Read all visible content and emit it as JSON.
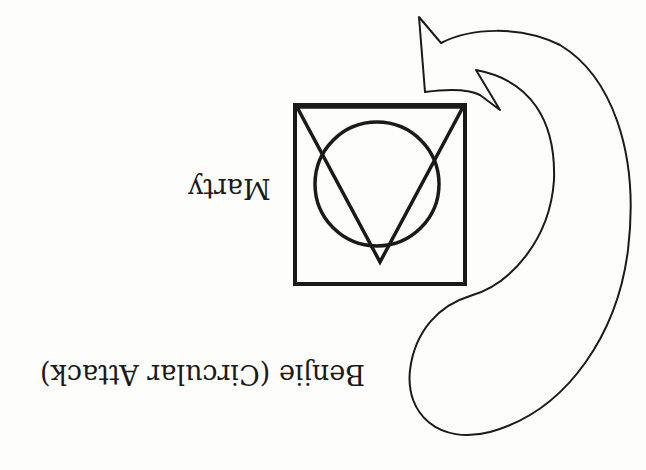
{
  "diagram": {
    "orientation": "rotated-180",
    "labels": {
      "marty": "Marty",
      "benjie": "Benjie (Circular Attack)"
    },
    "shapes": {
      "symbol": [
        "square",
        "circle",
        "inverted-triangle"
      ],
      "arrow": "curved-hook-arrow"
    },
    "colors": {
      "background": "#fdfdfb",
      "stroke": "#1a1a1a"
    }
  }
}
